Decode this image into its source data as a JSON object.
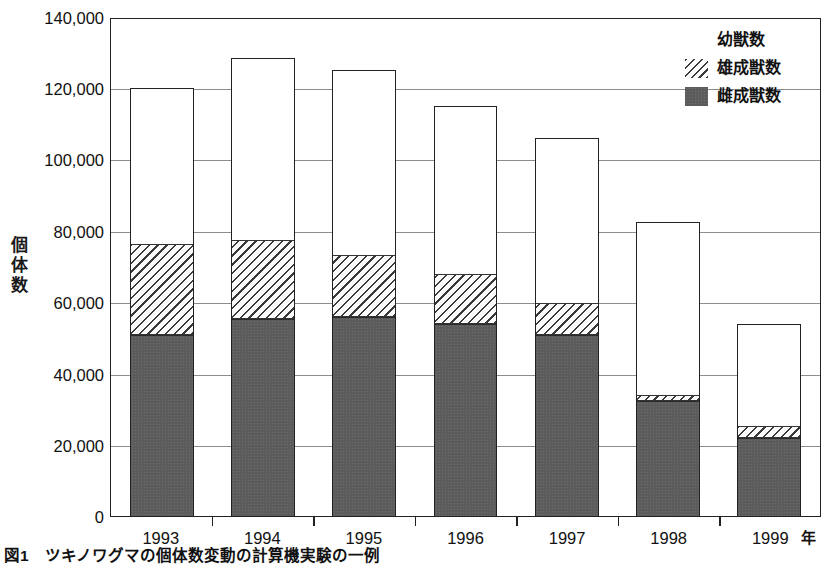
{
  "chart_data": {
    "type": "bar",
    "subtype": "stacked-vertical",
    "title": "",
    "xlabel": "年",
    "ylabel": "個体数",
    "categories": [
      "1993",
      "1994",
      "1995",
      "1996",
      "1997",
      "1998",
      "1999"
    ],
    "ylim": [
      0,
      140000
    ],
    "ytick_values": [
      0,
      20000,
      40000,
      60000,
      80000,
      100000,
      120000,
      140000
    ],
    "ytick_labels": [
      "0",
      "20,000",
      "40,000",
      "60,000",
      "80,000",
      "100,000",
      "120,000",
      "140,000"
    ],
    "grid": true,
    "grid_axis": "y",
    "legend_position": "top-right",
    "stack_order_bottom_to_top": [
      "雌成獣数",
      "雄成獣数",
      "幼獣数"
    ],
    "series": [
      {
        "name": "雌成獣数",
        "fill": "solid-dark-gray",
        "color": "#5c5c5c",
        "values": [
          51000,
          55500,
          56000,
          54000,
          51000,
          32500,
          22000
        ]
      },
      {
        "name": "雄成獣数",
        "fill": "diagonal-hatch",
        "color": "#3a3a3a",
        "values": [
          25500,
          22000,
          17500,
          14000,
          9000,
          1500,
          3500
        ]
      },
      {
        "name": "幼獣数",
        "fill": "white",
        "color": "#ffffff",
        "values": [
          43500,
          51000,
          51500,
          47000,
          46000,
          48500,
          28500
        ]
      }
    ],
    "totals": [
      120000,
      128500,
      125000,
      115000,
      106000,
      82500,
      54000
    ]
  },
  "legend": {
    "items": [
      {
        "label": "幼獣数",
        "swatch": "white"
      },
      {
        "label": "雄成獣数",
        "swatch": "hatch"
      },
      {
        "label": "雌成獣数",
        "swatch": "solid"
      }
    ]
  },
  "axis": {
    "y_title_chars": [
      "個",
      "体",
      "数"
    ],
    "x_unit": "年"
  },
  "caption": {
    "text": "図1　ツキノワグマの個体数変動の計算機実験の一例"
  },
  "colors": {
    "frame": "#222222",
    "gridline": "#8d8d8d",
    "female_fill": "#5c5c5c",
    "hatch_stroke": "#3a3a3a",
    "background": "#ffffff"
  }
}
